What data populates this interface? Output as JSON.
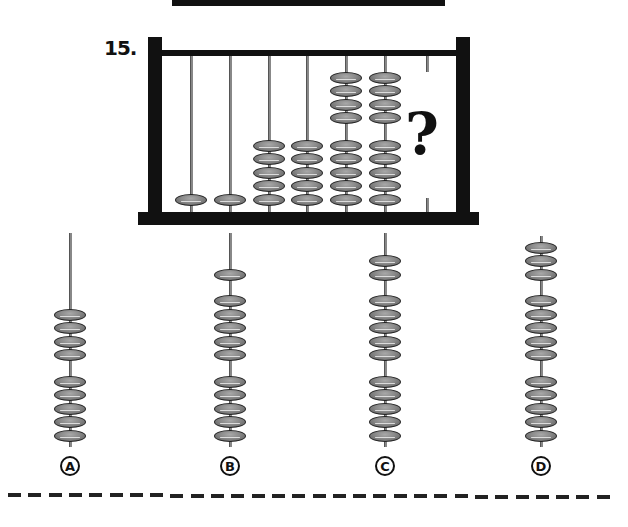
{
  "puzzle": {
    "number_label": "15.",
    "unknown_symbol": "?",
    "rod_bead_counts": [
      1,
      1,
      5,
      5,
      9,
      9
    ],
    "rod_bead_groups": [
      [
        1
      ],
      [
        1
      ],
      [
        5
      ],
      [
        5
      ],
      [
        4,
        5
      ],
      [
        4,
        5
      ]
    ],
    "colors": {
      "frame": "#111111",
      "bead": "#8a8a8a",
      "rod": "#888888"
    }
  },
  "options": [
    {
      "label": "A",
      "bead_groups": [
        4,
        5
      ],
      "total": 9
    },
    {
      "label": "B",
      "bead_groups": [
        1,
        5,
        5
      ],
      "total": 11
    },
    {
      "label": "C",
      "bead_groups": [
        2,
        5,
        5
      ],
      "total": 12
    },
    {
      "label": "D",
      "bead_groups": [
        3,
        5,
        5
      ],
      "total": 13
    }
  ]
}
